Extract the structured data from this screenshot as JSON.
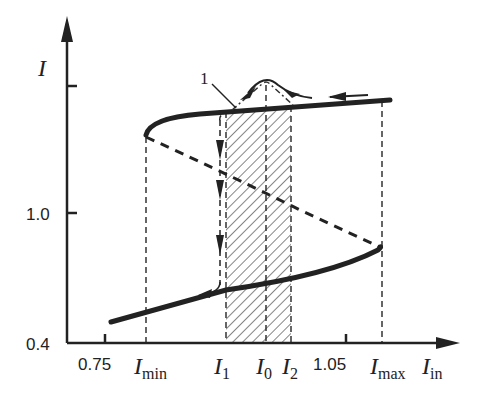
{
  "diagram": {
    "type": "hysteresis / bistability S-curve",
    "colors": {
      "ink": "#222222",
      "background": "#ffffff"
    },
    "y_axis": {
      "label": "I",
      "ticks": [
        {
          "label": "",
          "y_px": 86
        },
        {
          "label": "1.0",
          "y_px": 213
        },
        {
          "label": "0.4",
          "y_px": 343
        }
      ]
    },
    "x_axis": {
      "label": "I",
      "label_sub": "in",
      "ticks": [
        {
          "label": "0.75",
          "x_px": 105
        },
        {
          "label": "1.05",
          "x_px": 346
        }
      ],
      "markers": [
        {
          "name": "I",
          "sub": "min",
          "x_px": 146
        },
        {
          "name": "I",
          "sub": "1",
          "x_px": 226
        },
        {
          "name": "I",
          "sub": "0",
          "x_px": 266
        },
        {
          "name": "I",
          "sub": "2",
          "x_px": 291
        },
        {
          "name": "I",
          "sub": "max",
          "x_px": 382
        }
      ]
    },
    "curves": {
      "upper_stable_branch": "solid thick, from I_min fold to right edge",
      "middle_unstable_branch": "dashed, from I_min fold to I_max fold",
      "lower_stable_branch": "solid thick, from left edge to I_max fold"
    },
    "shaded_region": {
      "from": "I1",
      "to": "I2",
      "pattern": "diagonal hatch"
    },
    "callout": {
      "label": "1"
    }
  }
}
